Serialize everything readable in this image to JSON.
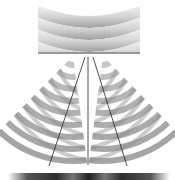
{
  "diagram": {
    "type": "double-slit-interference",
    "labels": [],
    "colors": {
      "background": "#ffffff",
      "wave_light": "#f2f2f2",
      "wave_dark": "#9a9a9a",
      "barrier": "#333333",
      "ray": "#222222",
      "screen_dark": "#3a3a3a",
      "screen_light": "#d8d8d8"
    },
    "incoming_waves": {
      "count": 4,
      "x_range": [
        38,
        140
      ],
      "y_range": [
        8,
        50
      ]
    },
    "barrier": {
      "y": 53,
      "x_start": 38,
      "x_end": 140,
      "slits_x": [
        73,
        103
      ]
    },
    "rays": [
      {
        "name": "left",
        "from": [
          85,
          57
        ],
        "to": [
          49,
          166
        ]
      },
      {
        "name": "center",
        "from": [
          88,
          57
        ],
        "to": [
          88,
          165
        ]
      },
      {
        "name": "right",
        "from": [
          93,
          57
        ],
        "to": [
          127,
          166
        ]
      }
    ],
    "screen": {
      "y": 173,
      "x_start": 8,
      "x_end": 170,
      "height": 7
    }
  }
}
